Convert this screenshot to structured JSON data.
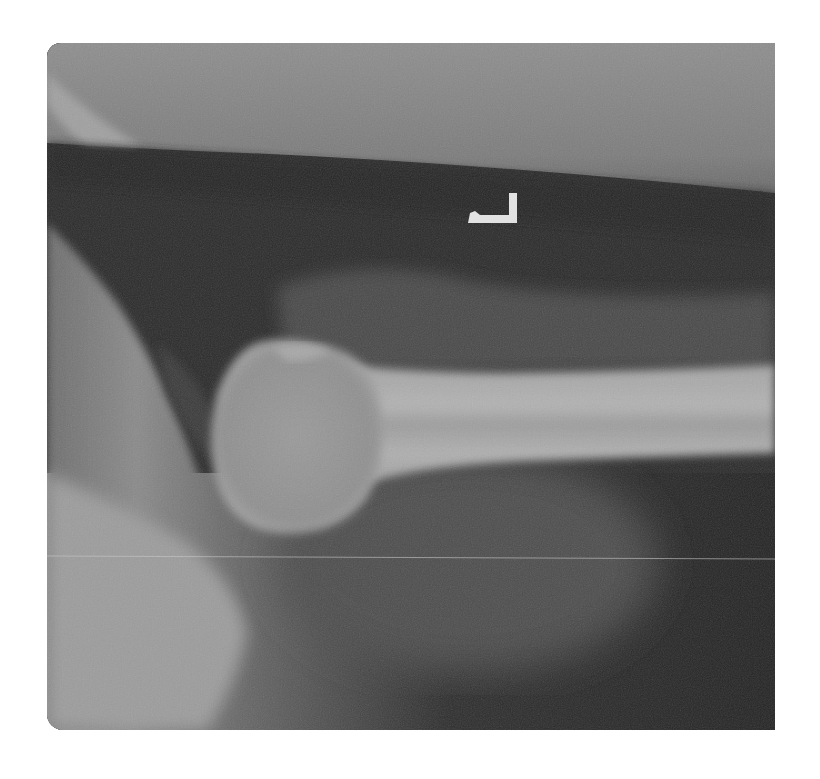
{
  "image": {
    "kind": "radiograph",
    "subject": "shoulder lateral / axillary view",
    "width": 820,
    "height": 779,
    "frame": {
      "left": 47,
      "top": 43,
      "width": 728,
      "height": 687
    },
    "colors": {
      "background": "#ffffff",
      "air_dark": "#2a2a2a",
      "soft_tissue_top": "#8a8a8a",
      "soft_tissue_mid": "#4a4a4a",
      "bone": "#a8a8a8",
      "bone_bright": "#bdbdbd",
      "marker": "#e6e6e6"
    },
    "side_marker": {
      "glyph": "L",
      "x": 468,
      "y": 196,
      "width": 60,
      "height": 30
    },
    "scan_line_y": 556
  }
}
